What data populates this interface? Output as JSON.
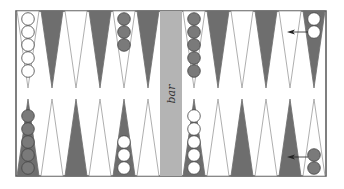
{
  "board": {
    "bar_label": "bar",
    "colors": {
      "border": "#555555",
      "dark_point": "#6e6e6e",
      "light_point_stroke": "#9a9a9a",
      "bar": "#b4b4b4",
      "dark_checker": "#7a7a7a",
      "white_checker": "#ffffff",
      "checker_stroke": "#444444",
      "arrow": "#222222"
    },
    "top_points": [
      {
        "shade": "light",
        "checkers": 5,
        "checker_color": "white"
      },
      {
        "shade": "dark",
        "checkers": 0
      },
      {
        "shade": "light",
        "checkers": 0
      },
      {
        "shade": "dark",
        "checkers": 0
      },
      {
        "shade": "light",
        "checkers": 3,
        "checker_color": "dark"
      },
      {
        "shade": "dark",
        "checkers": 0
      },
      {
        "shade": "light",
        "checkers": 5,
        "checker_color": "dark"
      },
      {
        "shade": "dark",
        "checkers": 0
      },
      {
        "shade": "light",
        "checkers": 0
      },
      {
        "shade": "dark",
        "checkers": 0
      },
      {
        "shade": "light",
        "checkers": 0
      },
      {
        "shade": "dark",
        "checkers": 2,
        "checker_color": "white"
      }
    ],
    "bottom_points": [
      {
        "shade": "dark",
        "checkers": 5,
        "checker_color": "dark"
      },
      {
        "shade": "light",
        "checkers": 0
      },
      {
        "shade": "dark",
        "checkers": 0
      },
      {
        "shade": "light",
        "checkers": 0
      },
      {
        "shade": "dark",
        "checkers": 3,
        "checker_color": "white"
      },
      {
        "shade": "light",
        "checkers": 0
      },
      {
        "shade": "dark",
        "checkers": 5,
        "checker_color": "white"
      },
      {
        "shade": "light",
        "checkers": 0
      },
      {
        "shade": "dark",
        "checkers": 0
      },
      {
        "shade": "light",
        "checkers": 0
      },
      {
        "shade": "dark",
        "checkers": 0
      },
      {
        "shade": "light",
        "checkers": 2,
        "checker_color": "dark"
      }
    ],
    "arrows": [
      {
        "row": "top",
        "from_point": 12,
        "direction": "left"
      },
      {
        "row": "bottom",
        "from_point": 12,
        "direction": "left"
      }
    ]
  }
}
